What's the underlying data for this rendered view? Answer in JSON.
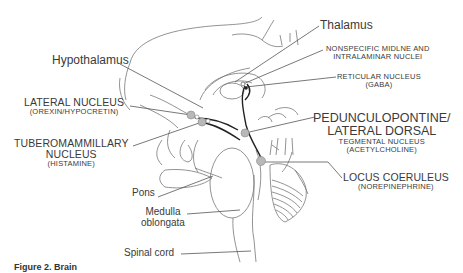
{
  "figure": {
    "caption": "Figure 2.  Brain"
  },
  "labels": {
    "thalamus": "Thalamus",
    "hypothalamus": "Hypothalamus",
    "nonspecific_1": "NONSPECIFIC MIDLNE AND",
    "nonspecific_2": "INTRALAMINAR NUCLEI",
    "reticular_1": "RETICULAR NUCLEUS",
    "reticular_2": "(GABA)",
    "lateral_1": "LATERAL NUCLEUS",
    "lateral_2": "(OREXIN/HYPOCRETIN)",
    "ppt_1": "PEDUNCULOPONTINE/",
    "ppt_2": "LATERAL DORSAL",
    "ppt_3": "TEGMENTAL NUCLEUS",
    "ppt_4": "(ACETYLCHOLINE)",
    "tmn_1": "TUBEROMAMMILLARY",
    "tmn_2": "NUCLEUS",
    "tmn_3": "(HISTAMINE)",
    "lc_1": "LOCUS COERULEUS",
    "lc_2": "(NOREPINEPHRINE)",
    "pons": "Pons",
    "medulla_1": "Medulla",
    "medulla_2": "oblongata",
    "spinal": "Spinal cord"
  },
  "colors": {
    "line": "#555555",
    "nucleus_fill": "#b8b8b8",
    "pathway": "#222222"
  }
}
